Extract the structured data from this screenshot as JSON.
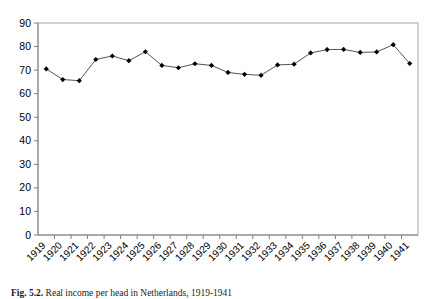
{
  "figure": {
    "caption_number": "Fig. 5.2.",
    "caption_text": "Real income per head in Netherlands, 1919-1941"
  },
  "chart_data": {
    "type": "line",
    "title": "",
    "subtitle": "",
    "xlabel": "",
    "ylabel": "",
    "categories": [
      "1919",
      "1920",
      "1921",
      "1922",
      "1923",
      "1924",
      "1925",
      "1926",
      "1927",
      "1928",
      "1929",
      "1930",
      "1931",
      "1932",
      "1933",
      "1934",
      "1935",
      "1936",
      "1937",
      "1938",
      "1939",
      "1940",
      "1941"
    ],
    "values": [
      70.5,
      66.0,
      65.5,
      74.5,
      76.0,
      74.0,
      77.8,
      72.0,
      71.0,
      72.7,
      72.0,
      69.0,
      68.2,
      67.8,
      72.2,
      72.5,
      77.3,
      78.7,
      78.8,
      77.5,
      77.7,
      80.8,
      72.8
    ],
    "series": [
      {
        "name": "series-1",
        "values": [
          70.5,
          66.0,
          65.5,
          74.5,
          76.0,
          74.0,
          77.8,
          72.0,
          71.0,
          72.7,
          72.0,
          69.0,
          68.2,
          67.8,
          72.2,
          72.5,
          77.3,
          78.7,
          78.8,
          77.5,
          77.7,
          80.8,
          72.8
        ]
      }
    ],
    "ylim": [
      0,
      90
    ],
    "yticks": [
      0,
      10,
      20,
      30,
      40,
      50,
      60,
      70,
      80,
      90
    ],
    "ytick_labels": [
      "0",
      "10",
      "20",
      "30",
      "40",
      "50",
      "60",
      "70",
      "80",
      "90"
    ],
    "xtick_labels": [
      "1919",
      "1920",
      "1921",
      "1922",
      "1923",
      "1924",
      "1925",
      "1926",
      "1927",
      "1928",
      "1929",
      "1930",
      "1931",
      "1932",
      "1933",
      "1934",
      "1935",
      "1936",
      "1937",
      "1938",
      "1939",
      "1940",
      "1941"
    ],
    "grid": false,
    "legend": false,
    "legend_position": "none",
    "marker": "diamond",
    "line_color": "#555555",
    "marker_color": "#000000",
    "axis_color": "#808080",
    "plot_border": true,
    "xtick_label_rotation": -45
  }
}
